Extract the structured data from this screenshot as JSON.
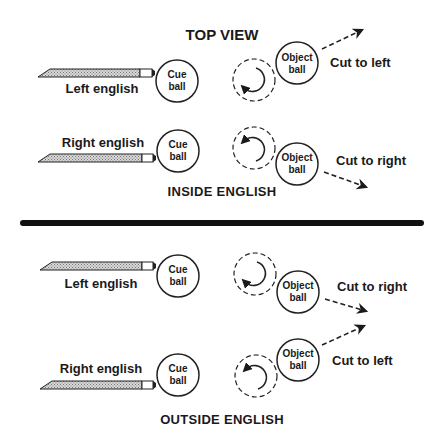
{
  "diagram": {
    "title": "TOP VIEW",
    "sections": [
      {
        "caption": "INSIDE ENGLISH",
        "rows": [
          {
            "cue_label": "Left english",
            "cue_ball": [
              "Cue",
              "ball"
            ],
            "object_ball": [
              "Object",
              "ball"
            ],
            "result": "Cut to left",
            "spin": "counterclockwise",
            "arrow_direction": "up-right"
          },
          {
            "cue_label": "Right english",
            "cue_ball": [
              "Cue",
              "ball"
            ],
            "object_ball": [
              "Object",
              "ball"
            ],
            "result": "Cut to right",
            "spin": "clockwise",
            "arrow_direction": "down-right"
          }
        ]
      },
      {
        "caption": "OUTSIDE ENGLISH",
        "rows": [
          {
            "cue_label": "Left english",
            "cue_ball": [
              "Cue",
              "ball"
            ],
            "object_ball": [
              "Object",
              "ball"
            ],
            "result": "Cut to right",
            "spin": "counterclockwise",
            "arrow_direction": "down-right"
          },
          {
            "cue_label": "Right english",
            "cue_ball": [
              "Cue",
              "ball"
            ],
            "object_ball": [
              "Object",
              "ball"
            ],
            "result": "Cut to left",
            "spin": "clockwise",
            "arrow_direction": "up-right"
          }
        ]
      }
    ]
  }
}
